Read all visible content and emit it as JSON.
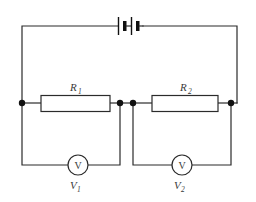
{
  "figure": {
    "kind": "electrical-circuit-diagram",
    "background_color": "#ffffff",
    "wire_color": "#2b2b2b",
    "label_color": "#3a3a3a",
    "node_color": "#111111",
    "width": 256,
    "height": 202
  },
  "source": {
    "name": "battery",
    "symbol": "two-cell-battery",
    "cell_count": 2,
    "label": ""
  },
  "resistors": [
    {
      "id": "R1",
      "name": "resistor-r1",
      "label_main": "R",
      "label_sub": "1",
      "label_full": "R1"
    },
    {
      "id": "R2",
      "name": "resistor-r2",
      "label_main": "R",
      "label_sub": "2",
      "label_full": "R2"
    }
  ],
  "voltmeters": [
    {
      "id": "V1",
      "name": "voltmeter-v1",
      "glyph": "V",
      "label_main": "V",
      "label_sub": "1",
      "label_full": "V1",
      "measures": "R1"
    },
    {
      "id": "V2",
      "name": "voltmeter-v2",
      "glyph": "V",
      "label_main": "V",
      "label_sub": "2",
      "label_full": "V2",
      "measures": "R2"
    }
  ],
  "nodes": [
    {
      "name": "node-left",
      "x": 22,
      "y": 103
    },
    {
      "name": "node-middle-left",
      "x": 120,
      "y": 103
    },
    {
      "name": "node-middle-right",
      "x": 133,
      "y": 103
    },
    {
      "name": "node-right",
      "x": 231,
      "y": 103
    }
  ]
}
